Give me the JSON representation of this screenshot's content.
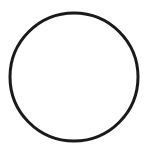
{
  "shape": {
    "type": "circle",
    "cx": 74,
    "cy": 77,
    "r": 64,
    "stroke": "#1a1a1a",
    "stroke_width": 3,
    "fill": "none"
  },
  "background": "#ffffff"
}
